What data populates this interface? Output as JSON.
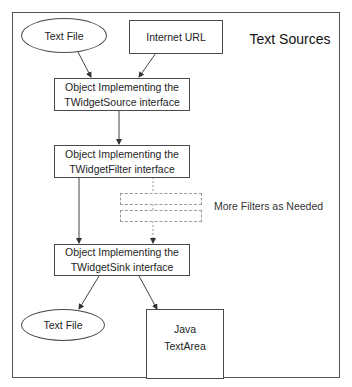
{
  "diagram": {
    "title": "Text Sources",
    "sources": [
      {
        "label": "Text File",
        "shape": "ellipse"
      },
      {
        "label": "Internet URL",
        "shape": "rectangle"
      }
    ],
    "source_object": {
      "line1": "Object Implementing the",
      "line2": "TWidgetSource interface"
    },
    "filter_object": {
      "line1": "Object Implementing the",
      "line2": "TWidgetFilter interface"
    },
    "more_filters_label": "More Filters as Needed",
    "sink_object": {
      "line1": "Object Implementing the",
      "line2": "TWidgetSink interface"
    },
    "sinks": [
      {
        "label": "Text File",
        "shape": "ellipse"
      },
      {
        "line1": "Java",
        "line2": "TextArea",
        "shape": "rectangle"
      }
    ],
    "colors": {
      "line": "#4a4a4a",
      "dashed": "#9a9a9a",
      "background": "#ffffff"
    }
  }
}
